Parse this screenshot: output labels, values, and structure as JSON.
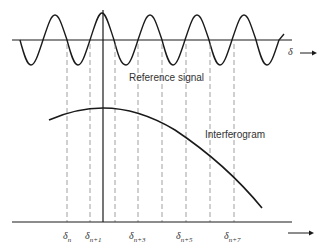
{
  "diagram": {
    "reference_label": "Reference signal",
    "interferogram_label": "Interferogram",
    "delta_axis_label": "δ",
    "bottom_labels": [
      {
        "base": "δ",
        "sub": "n"
      },
      {
        "base": "δ",
        "sub": "n+1"
      },
      {
        "base": "δ",
        "sub": "n+3"
      },
      {
        "base": "δ",
        "sub": "n+5"
      },
      {
        "base": "δ",
        "sub": "n+7"
      }
    ],
    "colors": {
      "line": "#1a1a1a",
      "dashed": "#888888",
      "text": "#333333"
    }
  }
}
